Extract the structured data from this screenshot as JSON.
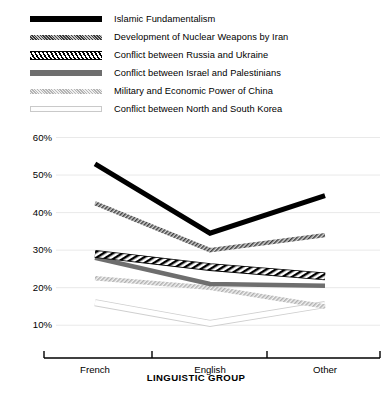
{
  "chart_data": {
    "type": "line",
    "title": "",
    "xlabel": "LINGUISTIC GROUP",
    "ylabel": "",
    "categories": [
      "French",
      "English",
      "Other"
    ],
    "ylim": [
      5,
      62
    ],
    "yticks": [
      10,
      20,
      30,
      40,
      50,
      60
    ],
    "ytick_labels": [
      "10%",
      "20%",
      "30%",
      "40%",
      "50%",
      "60%"
    ],
    "grid": true,
    "legend_position": "top-left",
    "series": [
      {
        "name": "Islamic Fundamentalism",
        "values": [
          53,
          34.5,
          44.5
        ],
        "style": "solid-black",
        "color": "#000000"
      },
      {
        "name": "Development of Nuclear Weapons by Iran",
        "values": [
          42.5,
          30,
          34
        ],
        "style": "fine-hatch-dark-grey",
        "color": "#555555"
      },
      {
        "name": "Conflict between Russia and  Ukraine",
        "values": [
          29,
          25.5,
          23
        ],
        "style": "diagonal-stripe-black-white",
        "color": "#111111"
      },
      {
        "name": "Conflict between Israel and  Palestinians",
        "values": [
          28,
          21,
          20.5
        ],
        "style": "solid-medium-grey",
        "color": "#6e6e6e"
      },
      {
        "name": "Military and Economic Power of China",
        "values": [
          22.5,
          20,
          15
        ],
        "style": "fine-hatch-light-grey",
        "color": "#c2c2c2"
      },
      {
        "name": "Conflict between North and South Korea",
        "values": [
          16,
          10.5,
          15.5
        ],
        "style": "outline-white",
        "color": "#d0d0d0"
      }
    ]
  },
  "legend": {
    "items": [
      {
        "label": "Islamic Fundamentalism",
        "swatch": "swatch-solid-black"
      },
      {
        "label": "Development of Nuclear Weapons by Iran",
        "swatch": "swatch-fine-hatch-dark"
      },
      {
        "label": "Conflict between Russia and  Ukraine",
        "swatch": "swatch-diagonal-stripe"
      },
      {
        "label": "Conflict between Israel and  Palestinians",
        "swatch": "swatch-solid-grey"
      },
      {
        "label": "Military and Economic Power of China",
        "swatch": "swatch-fine-hatch-light"
      },
      {
        "label": "Conflict between North and South Korea",
        "swatch": "swatch-outline"
      }
    ]
  },
  "axes": {
    "y_labels": [
      "60%",
      "50%",
      "40%",
      "30%",
      "20%",
      "10%"
    ],
    "x_labels": [
      "French",
      "English",
      "Other"
    ],
    "x_title": "LINGUISTIC GROUP"
  },
  "colors": {
    "background": "#ffffff",
    "axis": "#000000",
    "gridline": "#e9e9e9",
    "text": "#000000"
  }
}
